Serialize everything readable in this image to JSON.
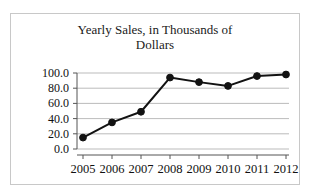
{
  "chart_data": {
    "type": "line",
    "title": "Yearly Sales, in Thousands of Dollars",
    "title_line1": "Yearly Sales, in Thousands of",
    "title_line2": "Dollars",
    "xlabel": "",
    "ylabel": "",
    "categories": [
      "2005",
      "2006",
      "2007",
      "2008",
      "2009",
      "2010",
      "2011",
      "2012"
    ],
    "values": [
      15,
      35,
      49,
      94,
      88,
      83,
      96,
      98
    ],
    "series": [
      {
        "name": "Yearly Sales",
        "values": [
          15,
          35,
          49,
          94,
          88,
          83,
          96,
          98
        ]
      }
    ],
    "ylim": [
      0,
      100
    ],
    "ytick_labels": [
      "100.0",
      "80.0",
      "60.0",
      "40.0",
      "20.0",
      "0.0"
    ],
    "ytick_values": [
      100,
      80,
      60,
      40,
      20,
      0
    ],
    "xtick_labels": [
      "2005",
      "2006",
      "2007",
      "2008",
      "2009",
      "2010",
      "2011",
      "2012"
    ],
    "grid": true,
    "legend": false,
    "legend_position": "none",
    "marker": "circle",
    "line_color": "#121212",
    "marker_color": "#121212",
    "grid_color": "#a9a9a9",
    "axis_color": "#555555",
    "background_color": "#ffffff",
    "border_color": "#c8c8c8"
  }
}
